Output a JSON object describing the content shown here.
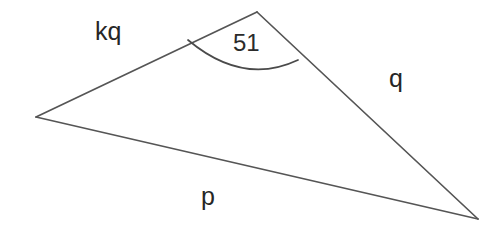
{
  "figure": {
    "kind": "geometry-diagram",
    "shape": "triangle",
    "background_color": "#ffffff",
    "stroke_color": "#555555",
    "text_color": "#262626",
    "canvas": {
      "width": 500,
      "height": 233
    },
    "vertices": [
      {
        "name": "apex",
        "x": 257,
        "y": 12
      },
      {
        "name": "left",
        "x": 36,
        "y": 117
      },
      {
        "name": "right",
        "x": 478,
        "y": 219
      }
    ],
    "sides": [
      {
        "id": "kq",
        "label": "kq",
        "from": "left",
        "to": "apex"
      },
      {
        "id": "q",
        "label": "q",
        "from": "apex",
        "to": "right"
      },
      {
        "id": "p",
        "label": "p",
        "from": "left",
        "to": "right"
      }
    ],
    "angle": {
      "at_vertex": "apex",
      "label": "51",
      "arc_start": {
        "x": 188,
        "y": 40
      },
      "arc_end": {
        "x": 298,
        "y": 60
      },
      "arc_sag_y": 68
    },
    "labels": {
      "side_kq": "kq",
      "side_q": "q",
      "side_p": "p",
      "angle_value": "51"
    }
  }
}
